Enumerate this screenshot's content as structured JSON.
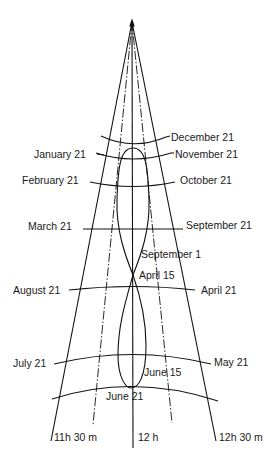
{
  "diagram": {
    "type": "analemma-meridian-diagram",
    "colors": {
      "line": "#111111",
      "text": "#1a1a1a",
      "background": "#ffffff"
    },
    "date_labels_left": [
      {
        "label": "January 21",
        "x": 45,
        "y": 157
      },
      {
        "label": "February 21",
        "x": 22,
        "y": 183
      },
      {
        "label": "March  21",
        "x": 28,
        "y": 229
      },
      {
        "label": "August 21",
        "x": 13,
        "y": 293
      },
      {
        "label": "July 21",
        "x": 13,
        "y": 366
      }
    ],
    "date_labels_right": [
      {
        "label": "December 21",
        "x": 171,
        "y": 140
      },
      {
        "label": "November 21",
        "x": 175,
        "y": 158
      },
      {
        "label": "October 21",
        "x": 180,
        "y": 183
      },
      {
        "label": "September 21",
        "x": 186,
        "y": 228
      },
      {
        "label": "April  21",
        "x": 201,
        "y": 293
      },
      {
        "label": "May  21",
        "x": 214,
        "y": 365
      }
    ],
    "analemma_labels": [
      {
        "label": "September 1",
        "x": 141,
        "y": 258
      },
      {
        "label": "April 15",
        "x": 139,
        "y": 279
      },
      {
        "label": "June 15",
        "x": 144,
        "y": 375
      },
      {
        "label": "June  21",
        "x": 106,
        "y": 399
      }
    ],
    "hour_labels": [
      {
        "label": "11h 30 m",
        "x": 54,
        "y": 441
      },
      {
        "label": "12 h",
        "x": 138,
        "y": 441
      },
      {
        "label": "12h 30 m",
        "x": 219,
        "y": 441
      }
    ]
  }
}
